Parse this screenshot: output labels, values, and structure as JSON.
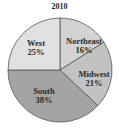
{
  "chart_data": {
    "type": "pie",
    "title": "2010",
    "categories": [
      "Northeast",
      "Midwest",
      "South",
      "West"
    ],
    "values": [
      16,
      21,
      38,
      25
    ],
    "labels": [
      "16%",
      "21%",
      "38%",
      "25%"
    ],
    "colors": [
      "#d3d3d3",
      "#c2c2c2",
      "#a4a4a4",
      "#e1e1e1"
    ],
    "start_angle": "top, clockwise",
    "legend": "none (labels inside slices)"
  },
  "slices": [
    {
      "name": "Northeast",
      "pct": "16%"
    },
    {
      "name": "Midwest",
      "pct": "21%"
    },
    {
      "name": "South",
      "pct": "38%"
    },
    {
      "name": "West",
      "pct": "25%"
    }
  ]
}
